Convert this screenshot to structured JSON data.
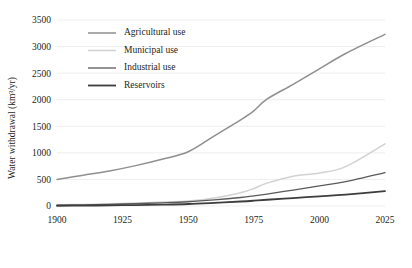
{
  "chart_data": {
    "type": "line",
    "title": "",
    "xlabel": "",
    "ylabel": "Water withdrawal (km³/yr)",
    "xlim": [
      1900,
      2025
    ],
    "ylim": [
      0,
      3500
    ],
    "grid": true,
    "legend_position": "upper-left-inside",
    "x_ticks": [
      "1900",
      "1925",
      "1950",
      "1975",
      "2000",
      "2025"
    ],
    "x_tick_values": [
      1900,
      1925,
      1950,
      1975,
      2000,
      2025
    ],
    "y_ticks": [
      "0",
      "500",
      "1000",
      "1500",
      "2000",
      "2500",
      "3000",
      "3500"
    ],
    "y_tick_values": [
      0,
      500,
      1000,
      1500,
      2000,
      2500,
      3000,
      3500
    ],
    "x": [
      1900,
      1910,
      1920,
      1930,
      1940,
      1950,
      1960,
      1970,
      1975,
      1980,
      1990,
      2000,
      2010,
      2025
    ],
    "series": [
      {
        "name": "Agricultural use",
        "color": "#8f8f8f",
        "width": 1.5,
        "values": [
          500,
          580,
          660,
          760,
          880,
          1020,
          1320,
          1620,
          1790,
          2010,
          2290,
          2580,
          2870,
          3230
        ]
      },
      {
        "name": "Municipal use",
        "color": "#d2d2d2",
        "width": 1.5,
        "values": [
          20,
          30,
          40,
          55,
          75,
          95,
          150,
          250,
          330,
          430,
          560,
          620,
          740,
          1170
        ]
      },
      {
        "name": "Industrial use",
        "color": "#5a5a5a",
        "width": 1.3,
        "values": [
          15,
          22,
          32,
          45,
          60,
          80,
          115,
          160,
          190,
          225,
          300,
          380,
          460,
          630
        ]
      },
      {
        "name": "Reservoirs",
        "color": "#3d3d3d",
        "width": 1.8,
        "values": [
          5,
          8,
          12,
          18,
          26,
          38,
          60,
          85,
          100,
          118,
          150,
          182,
          215,
          280
        ]
      }
    ]
  },
  "legend": {
    "entries": [
      {
        "label": "Agricultural use"
      },
      {
        "label": "Municipal use"
      },
      {
        "label": "Industrial use"
      },
      {
        "label": "Reservoirs"
      }
    ]
  },
  "style": {
    "grid_color": "#e2e2e2",
    "text_color": "#231f20",
    "background": "#ffffff"
  }
}
